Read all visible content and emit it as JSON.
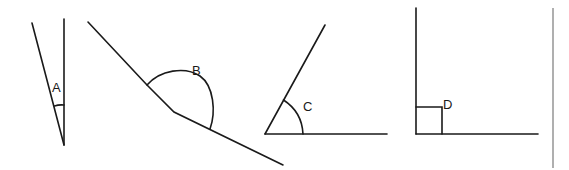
{
  "diagram": {
    "type": "angle-types",
    "figures": [
      {
        "id": "A",
        "label": "A",
        "kind": "acute (very narrow)",
        "marker": "arc"
      },
      {
        "id": "B",
        "label": "B",
        "kind": "reflex/obtuse",
        "marker": "arc"
      },
      {
        "id": "C",
        "label": "C",
        "kind": "acute",
        "marker": "arc"
      },
      {
        "id": "D",
        "label": "D",
        "kind": "right",
        "marker": "square"
      }
    ],
    "colors": {
      "stroke": "#1a1a1a",
      "separator": "#7a7a7a",
      "background": "#ffffff"
    }
  }
}
